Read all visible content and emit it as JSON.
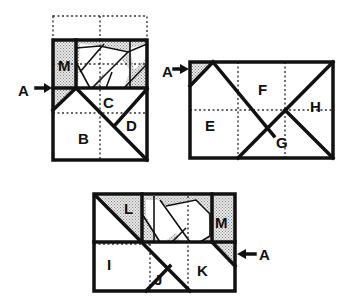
{
  "colors": {
    "line": "#111111",
    "shade": "#cfcfcf",
    "background": "#ffffff"
  },
  "figures": {
    "fig1": {
      "labels": {
        "M": "M",
        "A": "A",
        "C": "C",
        "D": "D",
        "B": "B"
      }
    },
    "fig2": {
      "labels": {
        "A": "A",
        "F": "F",
        "E": "E",
        "H": "H",
        "G": "G"
      }
    },
    "fig3": {
      "labels": {
        "L": "L",
        "M": "M",
        "I": "I",
        "J": "J",
        "K": "K",
        "A": "A"
      }
    }
  }
}
